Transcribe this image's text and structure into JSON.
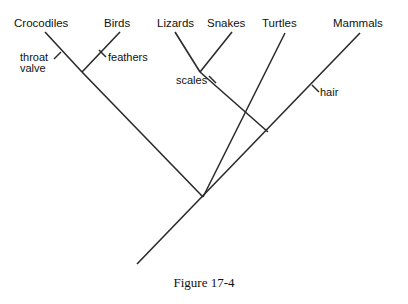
{
  "figure": {
    "caption": "Figure 17-4",
    "caption_x": 204,
    "caption_y": 287,
    "background": "#ffffff",
    "line_color": "#2b2b2b",
    "text_color": "#111111"
  },
  "chart_data": {
    "type": "diagram",
    "diagram_type": "cladogram",
    "title": "Figure 17-4",
    "taxa": [
      {
        "name": "Crocodiles",
        "label_x": 14,
        "label_y": 27,
        "tip_x": 45,
        "tip_y": 32
      },
      {
        "name": "Birds",
        "label_x": 104,
        "label_y": 27,
        "tip_x": 120,
        "tip_y": 32
      },
      {
        "name": "Lizards",
        "label_x": 157,
        "label_y": 27,
        "tip_x": 175,
        "tip_y": 32
      },
      {
        "name": "Snakes",
        "label_x": 207,
        "label_y": 27,
        "tip_x": 232,
        "tip_y": 32
      },
      {
        "name": "Turtles",
        "label_x": 262,
        "label_y": 27,
        "tip_x": 285,
        "tip_y": 33
      },
      {
        "name": "Mammals",
        "label_x": 333,
        "label_y": 27,
        "tip_x": 360,
        "tip_y": 33
      }
    ],
    "nodes": [
      {
        "id": "archosaurs",
        "x": 82,
        "y": 72,
        "children": [
          "Crocodiles",
          "Birds"
        ]
      },
      {
        "id": "squamates",
        "x": 200,
        "y": 72,
        "children": [
          "Lizards",
          "Snakes"
        ]
      },
      {
        "id": "diapsids-turtles",
        "x": 268,
        "y": 132,
        "children": [
          "squamates",
          "Turtles"
        ]
      },
      {
        "id": "reptiles",
        "x": 203,
        "y": 197,
        "children": [
          "archosaurs",
          "diapsids-turtles"
        ]
      },
      {
        "id": "amniote-root",
        "x": 137,
        "y": 264,
        "children": [
          "reptiles",
          "Mammals"
        ]
      }
    ],
    "branches": [
      {
        "name": "crocodiles-branch",
        "x1": 45,
        "y1": 32,
        "x2": 82,
        "y2": 72
      },
      {
        "name": "birds-branch",
        "x1": 120,
        "y1": 32,
        "x2": 82,
        "y2": 72
      },
      {
        "name": "lizards-branch",
        "x1": 175,
        "y1": 32,
        "x2": 200,
        "y2": 72
      },
      {
        "name": "snakes-branch",
        "x1": 232,
        "y1": 32,
        "x2": 200,
        "y2": 72
      },
      {
        "name": "squamates-stem",
        "x1": 200,
        "y1": 72,
        "x2": 268,
        "y2": 132
      },
      {
        "name": "turtles-branch",
        "x1": 285,
        "y1": 33,
        "x2": 203,
        "y2": 197
      },
      {
        "name": "archosaurs-stem",
        "x1": 82,
        "y1": 72,
        "x2": 203,
        "y2": 197
      },
      {
        "name": "mammals-branch",
        "x1": 360,
        "y1": 33,
        "x2": 137,
        "y2": 264
      }
    ],
    "traits": [
      {
        "name": "throat valve",
        "lines": [
          "throat",
          "valve"
        ],
        "label_x": 20,
        "label_y": 61,
        "line_height": 11,
        "tick_x1": 54,
        "tick_y1": 59,
        "tick_x2": 61,
        "tick_y2": 52,
        "on_branch": "crocodiles-branch"
      },
      {
        "name": "feathers",
        "lines": [
          "feathers"
        ],
        "label_x": 108,
        "label_y": 61,
        "line_height": 11,
        "tick_x1": 99,
        "tick_y1": 50,
        "tick_x2": 106,
        "tick_y2": 57,
        "on_branch": "birds-branch"
      },
      {
        "name": "scales",
        "lines": [
          "scales"
        ],
        "label_x": 176,
        "label_y": 84,
        "line_height": 11,
        "tick_x1": 209,
        "tick_y1": 76,
        "tick_x2": 216,
        "tick_y2": 83,
        "on_branch": "squamates-stem"
      },
      {
        "name": "hair",
        "lines": [
          "hair"
        ],
        "label_x": 320,
        "label_y": 96,
        "line_height": 11,
        "tick_x1": 312,
        "tick_y1": 85,
        "tick_x2": 319,
        "tick_y2": 92,
        "on_branch": "mammals-branch"
      }
    ],
    "xlabel": "",
    "ylabel": "",
    "grid": false,
    "legend": null
  }
}
